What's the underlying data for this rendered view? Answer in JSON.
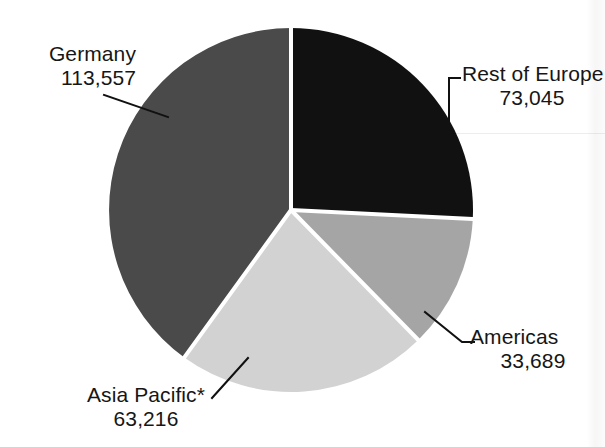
{
  "ghost_title_text": "",
  "chart_data": {
    "type": "pie",
    "title": "",
    "subtitle": "",
    "xlabel": "",
    "ylabel": "",
    "legend_position": "callout-labels",
    "grid": false,
    "total": 283507,
    "categories": [
      "Rest of Europe",
      "Americas",
      "Asia Pacific*",
      "Germany"
    ],
    "values": [
      73045,
      33689,
      63216,
      113557
    ],
    "value_labels": [
      "73,045",
      "33,689",
      "63,216",
      "113,557"
    ],
    "percentages": [
      25.8,
      11.9,
      22.3,
      40.1
    ],
    "colors": [
      "#111111",
      "#a5a5a5",
      "#d2d2d2",
      "#4a4a4a"
    ],
    "slices": [
      {
        "name": "Rest of Europe",
        "label": "Rest of Europe",
        "value": 73045,
        "value_label": "73,045",
        "percent": 25.8,
        "color": "#111111",
        "start_angle": 0,
        "end_angle": 92.8
      },
      {
        "name": "Americas",
        "label": "Americas",
        "value": 33689,
        "value_label": "33,689",
        "percent": 11.9,
        "color": "#a5a5a5",
        "start_angle": 92.8,
        "end_angle": 135.6
      },
      {
        "name": "Asia Pacific*",
        "label": "Asia Pacific*",
        "value": 63216,
        "value_label": "63,216",
        "percent": 22.3,
        "color": "#d2d2d2",
        "start_angle": 135.6,
        "end_angle": 215.9
      },
      {
        "name": "Germany",
        "label": "Germany",
        "value": 113557,
        "value_label": "113,557",
        "percent": 40.1,
        "color": "#4a4a4a",
        "start_angle": 215.9,
        "end_angle": 360
      }
    ]
  },
  "callouts": {
    "germany": {
      "label": "Germany",
      "value": "113,557"
    },
    "rest": {
      "label": "Rest of Europe",
      "value": "73,045"
    },
    "americas": {
      "label": "Americas",
      "value": "33,689"
    },
    "asia": {
      "label": "Asia Pacific*",
      "value": "63,216"
    }
  },
  "style": {
    "background": "#ffffff",
    "text_color": "#161616",
    "separator_color": "#ffffff",
    "leader_line_color": "#111111"
  }
}
